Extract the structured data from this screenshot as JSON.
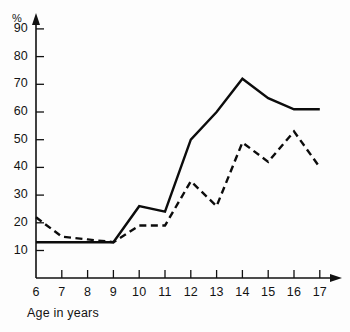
{
  "chart_data": {
    "type": "line",
    "title": "",
    "subtitle": "",
    "xlabel": "Age in years",
    "ylabel": "%",
    "x": [
      6,
      7,
      8,
      9,
      10,
      11,
      12,
      13,
      14,
      15,
      16,
      17
    ],
    "categories": [
      "6",
      "7",
      "8",
      "9",
      "10",
      "11",
      "12",
      "13",
      "14",
      "15",
      "16",
      "17"
    ],
    "xlim": [
      6,
      17
    ],
    "ylim": [
      0,
      95
    ],
    "yticks": [
      10,
      20,
      30,
      40,
      50,
      60,
      70,
      80,
      90
    ],
    "ytick_labels": [
      "10",
      "20",
      "30",
      "40",
      "50",
      "60",
      "70",
      "80",
      "90"
    ],
    "xticks": [
      6,
      7,
      8,
      9,
      10,
      11,
      12,
      13,
      14,
      15,
      16,
      17
    ],
    "xtick_labels": [
      "6",
      "7",
      "8",
      "9",
      "10",
      "11",
      "12",
      "13",
      "14",
      "15",
      "16",
      "17"
    ],
    "grid": false,
    "legend": "none",
    "series": [
      {
        "name": "solid-series",
        "style": "solid",
        "color": "#0c0c0c",
        "values": [
          13,
          13,
          13,
          13,
          26,
          24,
          50,
          60,
          72,
          65,
          61,
          61
        ]
      },
      {
        "name": "dashed-series",
        "style": "dashed",
        "color": "#0c0c0c",
        "values": [
          22,
          15,
          14,
          13,
          19,
          19,
          35,
          26,
          49,
          42,
          53,
          40
        ]
      }
    ]
  },
  "axes": {
    "y_title": "%",
    "x_title": "Age in years"
  }
}
